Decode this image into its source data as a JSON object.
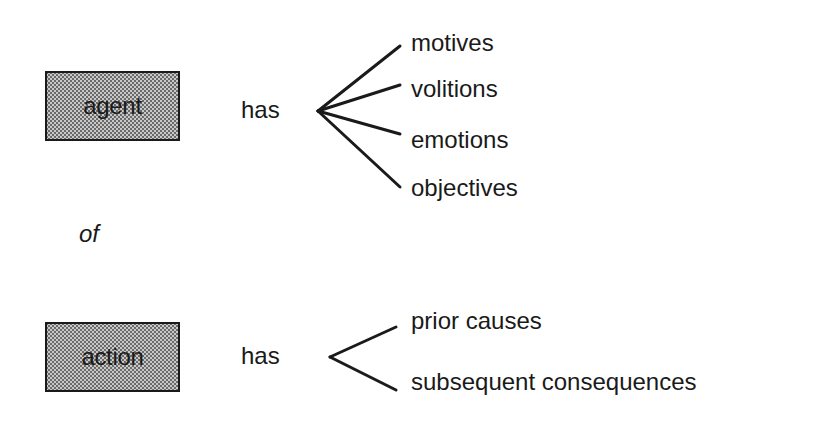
{
  "diagram": {
    "agent": {
      "label": "agent",
      "relation": "has",
      "attributes": [
        "motives",
        "volitions",
        "emotions",
        "objectives"
      ]
    },
    "connector": "of",
    "action": {
      "label": "action",
      "relation": "has",
      "attributes": [
        "prior causes",
        "subsequent consequences"
      ]
    }
  },
  "colors": {
    "ink": "#1a1a1a",
    "box_fill": "#c8c8c8",
    "background": "#ffffff"
  }
}
